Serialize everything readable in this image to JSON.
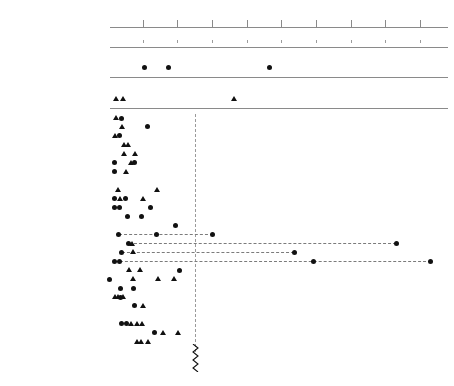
{
  "chart_data": {
    "type": "scatter",
    "title": "",
    "xlabel": "volume ratio",
    "ylabel": "",
    "xlim": [
      0,
      100
    ],
    "grid": false,
    "axis": {
      "ticks": [
        10,
        20,
        30,
        40,
        50,
        60,
        70,
        80,
        90
      ],
      "tick_labels": [
        "10",
        "20",
        "30",
        "40",
        "50",
        "60",
        "70",
        "80",
        "90"
      ]
    },
    "legend": {
      "entries": [
        {
          "marker": "circle",
          "name": "olla / bowl volume ratio"
        },
        {
          "marker": "triangle",
          "name": "jar / bowl volume ratio"
        }
      ],
      "position": "none"
    },
    "reference_panels": [
      {
        "title": "Shipibo olla / Bowl volume ratio",
        "marker": "circle",
        "values": [
          10.5,
          17.5,
          46.5
        ]
      },
      {
        "title": "Shipibo jar / Bowl volume ratio",
        "marker": "triangle",
        "values": [
          2.5,
          4.5,
          36.5
        ]
      }
    ],
    "threshold": {
      "value": 25,
      "style": "dashed-vertical",
      "left_label": "quotidian",
      "right_label": "fiesta",
      "divider": "zigzag"
    },
    "rows": [
      {
        "label": "Valdivia 2–3",
        "circles": [
          4.0
        ],
        "triangles": [
          2.5
        ],
        "dash_to": null
      },
      {
        "label": "Valdivia 4–5",
        "circles": [
          11.5
        ],
        "triangles": [
          4.0
        ],
        "dash_to": null
      },
      {
        "label": "Valdivia 6–7",
        "circles": [
          3.5
        ],
        "triangles": [
          2.0
        ],
        "dash_to": null
      },
      {
        "label": "Early Cotocollao",
        "circles": [],
        "triangles": [
          4.7,
          5.8
        ],
        "dash_to": null
      },
      {
        "label": "Middle Cotocollao",
        "circles": [],
        "triangles": [
          4.8,
          7.8
        ],
        "dash_to": null
      },
      {
        "label": "Late Cotocollao",
        "circles": [
          2.0,
          7.8
        ],
        "triangles": [
          6.8
        ],
        "dash_to": null
      },
      {
        "label": "Catamayo A",
        "circles": [
          2.0
        ],
        "triangles": [
          5.2
        ],
        "dash_to": null
      },
      {
        "label": "Catamayo B",
        "circles": [],
        "triangles": [],
        "dash_to": null
      },
      {
        "label": "Catamayo C",
        "circles": [],
        "triangles": [
          3.0,
          14.3
        ],
        "dash_to": null
      },
      {
        "label": "Catamayo D",
        "circles": [
          2.0,
          5.0
        ],
        "triangles": [
          3.5,
          10.2
        ],
        "dash_to": null
      },
      {
        "label": "Early Guañape",
        "circles": [
          2.0,
          3.5,
          12.2
        ],
        "triangles": [],
        "dash_to": null
      },
      {
        "label": "Toril",
        "circles": [
          5.7,
          9.8
        ],
        "triangles": [],
        "dash_to": null
      },
      {
        "label": "Yesopampa",
        "circles": [
          19.5
        ],
        "triangles": [],
        "dash_to": null
      },
      {
        "label": "MMA",
        "circles": [
          3.2,
          14.1,
          30.2
        ],
        "triangles": [],
        "dash_to": 30.2
      },
      {
        "label": "Kotosh Waira-jirca",
        "circles": [
          6.0,
          83.2
        ],
        "triangles": [
          7.0
        ],
        "dash_to": 83.2
      },
      {
        "label": "Kotosh Kotosh",
        "circles": [
          4.0,
          53.8
        ],
        "triangles": [
          7.3
        ],
        "dash_to": 53.8
      },
      {
        "label": "Kotosh Chavín",
        "circles": [
          2.0,
          3.5,
          59.3,
          93.1
        ],
        "triangles": [],
        "dash_to": 93.1
      },
      {
        "label": "La Pampa M8",
        "circles": [
          20.8
        ],
        "triangles": [
          6.2,
          9.2
        ],
        "dash_to": null
      },
      {
        "label": "La Pampa M4",
        "circles": [
          0.6
        ],
        "triangles": [
          7.3,
          14.5,
          19.2
        ],
        "dash_to": null
      },
      {
        "label": "La Conga phase at CB",
        "circles": [
          3.7,
          7.3
        ],
        "triangles": [],
        "dash_to": null
      },
      {
        "label": "Cerro Blanco phase at CB",
        "circles": [
          3.6
        ],
        "triangles": [
          2.1,
          3.0,
          4.4
        ],
        "dash_to": null
      },
      {
        "label": "Soterra phase at CB",
        "circles": [
          7.8
        ],
        "triangles": [
          10.0
        ],
        "dash_to": null
      },
      {
        "label": "Early Huacaloma",
        "circles": [],
        "triangles": [],
        "dash_to": null
      },
      {
        "label": "Late Huacaloma",
        "circles": [
          4.0,
          5.3
        ],
        "triangles": [
          6.6,
          8.3,
          9.8
        ],
        "dash_to": null
      },
      {
        "label": "EL",
        "circles": [
          13.6
        ],
        "triangles": [
          16.0,
          20.1
        ],
        "dash_to": null
      },
      {
        "label": "Layzón phase at Huacaloma",
        "circles": [],
        "triangles": [
          8.5,
          9.7,
          11.5
        ],
        "dash_to": null
      }
    ]
  }
}
